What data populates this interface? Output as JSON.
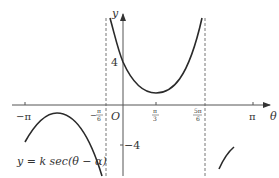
{
  "diagram": {
    "type": "function-graph",
    "equation": "y = k sec(θ − α)",
    "axes": {
      "x_label": "θ",
      "y_label": "y",
      "origin_label": "O"
    },
    "x_ticks": [
      {
        "label": "−π",
        "num": "",
        "den": ""
      },
      {
        "label": "",
        "num": "π",
        "den": "6",
        "sign": "−"
      },
      {
        "label": "",
        "num": "π",
        "den": "3",
        "sign": ""
      },
      {
        "label": "",
        "num": "5π",
        "den": "6",
        "sign": ""
      },
      {
        "label": "π",
        "num": "",
        "den": ""
      }
    ],
    "y_ticks": [
      {
        "label": "4"
      },
      {
        "label": "−4"
      }
    ],
    "asymptotes": [
      "θ = −π/6",
      "θ = 5π/6"
    ],
    "key_points": {
      "y_intercept": 4,
      "local_min_theta": "π/3",
      "local_max_value": -4
    },
    "colors": {
      "curve": "#2a2a2a",
      "axis": "#555555",
      "asymptote": "#777777"
    }
  }
}
